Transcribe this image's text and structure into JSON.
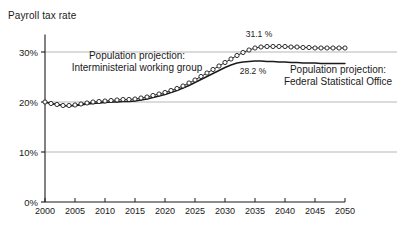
{
  "header": {
    "title": "Payroll tax rate"
  },
  "chart_data": {
    "type": "line",
    "title": "Payroll tax rate",
    "xlabel": "",
    "ylabel": "",
    "xlim": [
      2000,
      2050
    ],
    "ylim": [
      0,
      35
    ],
    "yticks": [
      0,
      10,
      20,
      30
    ],
    "ytick_labels": [
      "0%",
      "10%",
      "20%",
      "30%"
    ],
    "xticks": [
      2000,
      2005,
      2010,
      2015,
      2020,
      2025,
      2030,
      2035,
      2040,
      2045,
      2050
    ],
    "xtick_labels": [
      "2000",
      "2005",
      "2010",
      "2015",
      "2020",
      "2025",
      "2030",
      "2035",
      "2040",
      "2045",
      "2050"
    ],
    "grid": true,
    "grid_color": "#9a9a9a",
    "legend_position": "inline-annotations",
    "annotations": [
      {
        "name": "interministerial-label",
        "line1": "Population projection:",
        "line2": "Interministerial working group",
        "x": 137,
        "y": 59
      },
      {
        "name": "federal-office-label",
        "line1": "Population projection:",
        "line2": "Federal Statistical Office",
        "x": 338,
        "y": 73
      }
    ],
    "data_labels": [
      {
        "name": "peak-interministerial",
        "text": "31.1 %",
        "value": 31.1,
        "year": 2037,
        "x": 259,
        "y": 37
      },
      {
        "name": "peak-federal",
        "text": "28.2 %",
        "value": 28.2,
        "year": 2035,
        "x": 253,
        "y": 74
      }
    ],
    "series": [
      {
        "name": "Population projection: Interministerial working group",
        "marker": "circle",
        "color": "#1a1a1a",
        "x": [
          2000,
          2001,
          2002,
          2003,
          2004,
          2005,
          2006,
          2007,
          2008,
          2009,
          2010,
          2011,
          2012,
          2013,
          2014,
          2015,
          2016,
          2017,
          2018,
          2019,
          2020,
          2021,
          2022,
          2023,
          2024,
          2025,
          2026,
          2027,
          2028,
          2029,
          2030,
          2031,
          2032,
          2033,
          2034,
          2035,
          2036,
          2037,
          2038,
          2039,
          2040,
          2041,
          2042,
          2043,
          2044,
          2045,
          2046,
          2047,
          2048,
          2049,
          2050
        ],
        "values": [
          20.0,
          19.7,
          19.5,
          19.3,
          19.3,
          19.4,
          19.6,
          19.8,
          20.0,
          20.1,
          20.2,
          20.3,
          20.4,
          20.5,
          20.5,
          20.6,
          20.8,
          21.0,
          21.3,
          21.6,
          21.9,
          22.3,
          22.7,
          23.2,
          23.8,
          24.4,
          25.1,
          25.8,
          26.5,
          27.2,
          27.9,
          28.6,
          29.3,
          29.9,
          30.4,
          30.8,
          31.0,
          31.1,
          31.1,
          31.1,
          31.1,
          31.0,
          31.0,
          30.9,
          30.9,
          30.8,
          30.8,
          30.8,
          30.8,
          30.8,
          30.8
        ]
      },
      {
        "name": "Population projection: Federal Statistical Office",
        "marker": "none",
        "color": "#1a1a1a",
        "x": [
          2000,
          2001,
          2002,
          2003,
          2004,
          2005,
          2006,
          2007,
          2008,
          2009,
          2010,
          2011,
          2012,
          2013,
          2014,
          2015,
          2016,
          2017,
          2018,
          2019,
          2020,
          2021,
          2022,
          2023,
          2024,
          2025,
          2026,
          2027,
          2028,
          2029,
          2030,
          2031,
          2032,
          2033,
          2034,
          2035,
          2036,
          2037,
          2038,
          2039,
          2040,
          2041,
          2042,
          2043,
          2044,
          2045,
          2046,
          2047,
          2048,
          2049,
          2050
        ],
        "values": [
          20.0,
          19.7,
          19.5,
          19.3,
          19.2,
          19.3,
          19.4,
          19.6,
          19.7,
          19.8,
          19.9,
          20.0,
          20.0,
          20.1,
          20.1,
          20.2,
          20.4,
          20.6,
          20.9,
          21.2,
          21.5,
          21.9,
          22.3,
          22.8,
          23.3,
          23.9,
          24.5,
          25.1,
          25.7,
          26.3,
          26.9,
          27.4,
          27.8,
          28.0,
          28.1,
          28.2,
          28.2,
          28.1,
          28.1,
          28.0,
          28.0,
          27.9,
          27.9,
          27.8,
          27.8,
          27.8,
          27.7,
          27.7,
          27.7,
          27.7,
          27.7
        ]
      }
    ]
  },
  "axis": {
    "line_color": "#1a1a1a"
  }
}
